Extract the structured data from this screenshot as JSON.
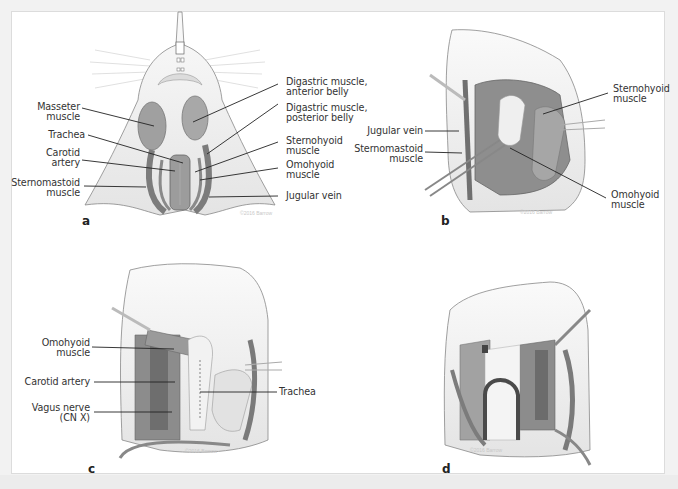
{
  "figure": {
    "panels": [
      {
        "id": "a",
        "letter": "a",
        "labels_left": [
          {
            "line1": "Masseter",
            "line2": "muscle"
          },
          {
            "line1": "Trachea",
            "line2": ""
          },
          {
            "line1": "Carotid",
            "line2": "artery"
          },
          {
            "line1": "Sternomastoid",
            "line2": "muscle"
          }
        ],
        "labels_right": [
          {
            "line1": "Digastric muscle,",
            "line2": "anterior belly"
          },
          {
            "line1": "Digastric muscle,",
            "line2": "posterior belly"
          },
          {
            "line1": "Sternohyoid",
            "line2": "muscle"
          },
          {
            "line1": "Omohyoid",
            "line2": "muscle"
          },
          {
            "line1": "Jugular vein",
            "line2": ""
          }
        ],
        "watermark": "©2016 Barrow"
      },
      {
        "id": "b",
        "letter": "b",
        "labels_left": [
          {
            "line1": "Jugular vein",
            "line2": ""
          },
          {
            "line1": "Sternomastoid",
            "line2": "muscle"
          }
        ],
        "labels_right": [
          {
            "line1": "Sternohyoid",
            "line2": "muscle"
          },
          {
            "line1": "Omohyoid",
            "line2": "muscle"
          }
        ],
        "watermark": "©2016 Barrow"
      },
      {
        "id": "c",
        "letter": "c",
        "labels_left": [
          {
            "line1": "Omohyoid",
            "line2": "muscle"
          },
          {
            "line1": "Carotid artery",
            "line2": ""
          },
          {
            "line1": "Vagus nerve",
            "line2": "(CN X)"
          }
        ],
        "labels_right": [
          {
            "line1": "Trachea",
            "line2": ""
          }
        ],
        "watermark": "©2016 Barrow"
      },
      {
        "id": "d",
        "letter": "d",
        "labels_left": [],
        "labels_right": [],
        "watermark": "©2016 Barrow"
      }
    ]
  },
  "colors": {
    "muscle": "#9a9a9a",
    "muscle_dark": "#7a7a7a",
    "tissue": "#e6e6e6",
    "outline": "#777777",
    "leader_line": "#222222",
    "label_text": "#333333"
  }
}
